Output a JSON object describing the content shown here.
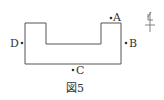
{
  "figure": {
    "caption": "図5",
    "outline_color": "#555555",
    "points": [
      {
        "id": "A",
        "label": "A"
      },
      {
        "id": "B",
        "label": "B"
      },
      {
        "id": "C",
        "label": "C"
      },
      {
        "id": "D",
        "label": "D"
      }
    ],
    "north_symbol": "north-arrow"
  }
}
